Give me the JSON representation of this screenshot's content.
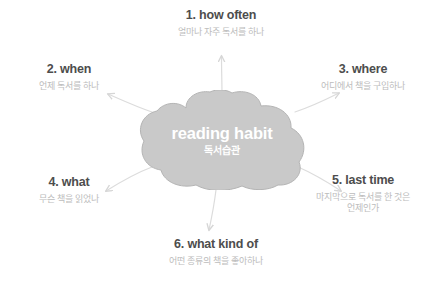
{
  "diagram": {
    "center": {
      "title": "reading habit",
      "subtitle": "독서습관",
      "fill_color": "#c9c9c9",
      "stroke_color": "#b3b3b3",
      "text_color": "#ffffff"
    },
    "arrow_color": "#d9d9d9",
    "title_color": "#4d4d4d",
    "subtitle_color": "#bcbcbc",
    "background_color": "#ffffff",
    "nodes": [
      {
        "number": "1.",
        "title": "1. how often",
        "subtitle_line1": "얼마나 자주 독서를 하나",
        "subtitle_line2": "",
        "align": "center",
        "arrow_icon": "arrow-up-icon"
      },
      {
        "number": "2.",
        "title": "2. when",
        "subtitle_line1": "언제 독서를 하나",
        "subtitle_line2": "",
        "align": "center",
        "arrow_icon": "arrow-upper-left-icon"
      },
      {
        "number": "3.",
        "title": "3. where",
        "subtitle_line1": "어디에서 책을 구입하나",
        "subtitle_line2": "",
        "align": "center",
        "arrow_icon": "arrow-upper-right-icon"
      },
      {
        "number": "4.",
        "title": "4. what",
        "subtitle_line1": "무슨 책을 읽었나",
        "subtitle_line2": "",
        "align": "center",
        "arrow_icon": "arrow-lower-left-icon"
      },
      {
        "number": "5.",
        "title": "5. last time",
        "subtitle_line1": "마지막으로 독서를 한 것은",
        "subtitle_line2": "언제인가",
        "align": "center",
        "arrow_icon": "arrow-lower-right-icon"
      },
      {
        "number": "6.",
        "title": "6. what kind of",
        "subtitle_line1": "어떤 종류의 책을 좋아하나",
        "subtitle_line2": "",
        "align": "center",
        "arrow_icon": "arrow-down-icon"
      }
    ]
  }
}
